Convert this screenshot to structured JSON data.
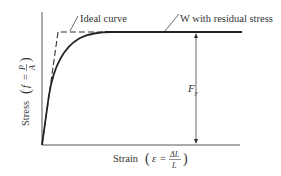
{
  "diagram": {
    "title": "",
    "type": "stress-strain curve",
    "labels": {
      "ideal_curve": "Ideal curve",
      "residual": "W with residual stress",
      "fy": "F",
      "fy_sub": "y",
      "y_axis_word": "Stress",
      "y_axis_var": "f",
      "y_axis_eq": "=",
      "y_axis_num": "P",
      "y_axis_den": "A",
      "x_axis_word": "Strain",
      "x_axis_var": "ε",
      "x_axis_eq": "=",
      "x_axis_num": "ΔL",
      "x_axis_den": "L"
    },
    "colors": {
      "line": "#222222",
      "axis": "#444444",
      "text": "#333333"
    }
  }
}
